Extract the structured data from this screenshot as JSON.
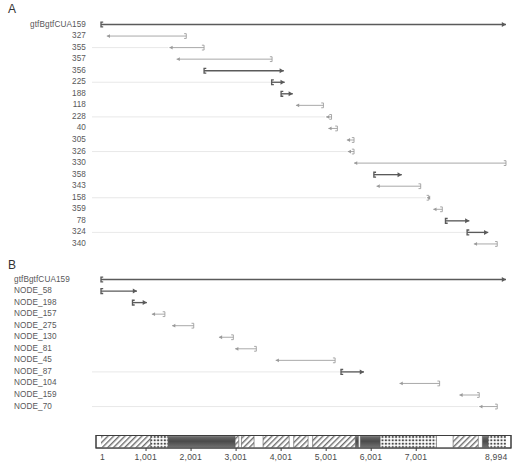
{
  "figure": {
    "type": "genomic-alignment-map",
    "width": 515,
    "height": 473,
    "accent": "#6b6b6b",
    "dark_bar": "#5a5a5a",
    "light_bar": "#9a9a9a",
    "guide_line": "#d8d8d8",
    "text_color": "#58585a"
  },
  "panels": [
    {
      "letter": "A",
      "rows": [
        {
          "label": "gtfBgtfCUA159",
          "start": 1,
          "end": 8994,
          "orientation": "right",
          "weight": "heavy",
          "guide": false
        },
        {
          "label": "327",
          "start": 130,
          "end": 1895,
          "orientation": "left",
          "weight": "light",
          "guide": false
        },
        {
          "label": "355",
          "start": 1520,
          "end": 2290,
          "orientation": "left",
          "weight": "light",
          "guide": true
        },
        {
          "label": "357",
          "start": 1680,
          "end": 3800,
          "orientation": "left",
          "weight": "light",
          "guide": false
        },
        {
          "label": "356",
          "start": 2290,
          "end": 4060,
          "orientation": "right",
          "weight": "heavy",
          "guide": false
        },
        {
          "label": "225",
          "start": 3790,
          "end": 4080,
          "orientation": "right",
          "weight": "heavy",
          "guide": true
        },
        {
          "label": "188",
          "start": 4000,
          "end": 4260,
          "orientation": "right",
          "weight": "heavy",
          "guide": false
        },
        {
          "label": "118",
          "start": 4330,
          "end": 4940,
          "orientation": "left",
          "weight": "light",
          "guide": false
        },
        {
          "label": "228",
          "start": 5000,
          "end": 5120,
          "orientation": "left",
          "weight": "light",
          "guide": true
        },
        {
          "label": "40",
          "start": 5050,
          "end": 5250,
          "orientation": "left",
          "weight": "light",
          "guide": false
        },
        {
          "label": "305",
          "start": 5460,
          "end": 5620,
          "orientation": "left",
          "weight": "light",
          "guide": false
        },
        {
          "label": "326",
          "start": 5480,
          "end": 5620,
          "orientation": "left",
          "weight": "light",
          "guide": true
        },
        {
          "label": "330",
          "start": 5620,
          "end": 9000,
          "orientation": "left",
          "weight": "light",
          "guide": false
        },
        {
          "label": "358",
          "start": 6060,
          "end": 6680,
          "orientation": "right",
          "weight": "heavy",
          "guide": false
        },
        {
          "label": "343",
          "start": 6120,
          "end": 7100,
          "orientation": "left",
          "weight": "light",
          "guide": false
        },
        {
          "label": "158",
          "start": 7240,
          "end": 7280,
          "orientation": "left",
          "weight": "light",
          "guide": true
        },
        {
          "label": "359",
          "start": 7380,
          "end": 7580,
          "orientation": "left",
          "weight": "light",
          "guide": false
        },
        {
          "label": "78",
          "start": 7650,
          "end": 8180,
          "orientation": "right",
          "weight": "heavy",
          "guide": false
        },
        {
          "label": "324",
          "start": 8130,
          "end": 8600,
          "orientation": "right",
          "weight": "heavy",
          "guide": true
        },
        {
          "label": "340",
          "start": 8280,
          "end": 8800,
          "orientation": "left",
          "weight": "light",
          "guide": false
        }
      ]
    },
    {
      "letter": "B",
      "rows": [
        {
          "label": "gtfBgtfCUA159",
          "start": 1,
          "end": 8994,
          "orientation": "right",
          "weight": "heavy",
          "guide": false
        },
        {
          "label": "NODE_58",
          "start": 1,
          "end": 800,
          "orientation": "right",
          "weight": "heavy",
          "guide": false
        },
        {
          "label": "NODE_198",
          "start": 700,
          "end": 1020,
          "orientation": "right",
          "weight": "heavy",
          "guide": false
        },
        {
          "label": "NODE_157",
          "start": 1130,
          "end": 1420,
          "orientation": "left",
          "weight": "light",
          "guide": false
        },
        {
          "label": "NODE_275",
          "start": 1580,
          "end": 2060,
          "orientation": "left",
          "weight": "light",
          "guide": false
        },
        {
          "label": "NODE_130",
          "start": 2620,
          "end": 2940,
          "orientation": "left",
          "weight": "light",
          "guide": false
        },
        {
          "label": "NODE_81",
          "start": 2980,
          "end": 3450,
          "orientation": "left",
          "weight": "light",
          "guide": false
        },
        {
          "label": "NODE_45",
          "start": 3880,
          "end": 5200,
          "orientation": "left",
          "weight": "light",
          "guide": false
        },
        {
          "label": "NODE_87",
          "start": 5330,
          "end": 5840,
          "orientation": "right",
          "weight": "heavy",
          "guide": true
        },
        {
          "label": "NODE_104",
          "start": 6630,
          "end": 7520,
          "orientation": "left",
          "weight": "light",
          "guide": false
        },
        {
          "label": "NODE_159",
          "start": 7960,
          "end": 8400,
          "orientation": "left",
          "weight": "light",
          "guide": false
        },
        {
          "label": "NODE_70",
          "start": 8400,
          "end": 8800,
          "orientation": "left",
          "weight": "light",
          "guide": true
        }
      ]
    }
  ],
  "axis": {
    "label_name": "coordinate-axis",
    "min": 1,
    "max": 8994,
    "ticks": [
      {
        "value": 1,
        "label": "1"
      },
      {
        "value": 1001,
        "label": "1,001"
      },
      {
        "value": 2001,
        "label": "2,001"
      },
      {
        "value": 3001,
        "label": "3,001"
      },
      {
        "value": 4001,
        "label": "4,001"
      },
      {
        "value": 5001,
        "label": "5,001"
      },
      {
        "value": 6001,
        "label": "6,001"
      },
      {
        "value": 7001,
        "label": "7,001"
      },
      {
        "value": 8994,
        "label": "8,994"
      }
    ],
    "segments": [
      {
        "start": 1,
        "end": 1100,
        "fill": "hatch"
      },
      {
        "start": 1100,
        "end": 1490,
        "fill": "dots"
      },
      {
        "start": 1490,
        "end": 2980,
        "fill": "solid-dark"
      },
      {
        "start": 2980,
        "end": 3060,
        "fill": "hatch"
      },
      {
        "start": 3060,
        "end": 3120,
        "fill": "white"
      },
      {
        "start": 3120,
        "end": 3400,
        "fill": "hatch"
      },
      {
        "start": 3400,
        "end": 3600,
        "fill": "white"
      },
      {
        "start": 3600,
        "end": 4180,
        "fill": "hatch"
      },
      {
        "start": 4180,
        "end": 4280,
        "fill": "white"
      },
      {
        "start": 4280,
        "end": 4600,
        "fill": "hatch"
      },
      {
        "start": 4600,
        "end": 4700,
        "fill": "white"
      },
      {
        "start": 4700,
        "end": 5650,
        "fill": "hatch"
      },
      {
        "start": 5650,
        "end": 5720,
        "fill": "solid-dark"
      },
      {
        "start": 5720,
        "end": 5760,
        "fill": "white"
      },
      {
        "start": 5760,
        "end": 6200,
        "fill": "solid-dark"
      },
      {
        "start": 6200,
        "end": 7450,
        "fill": "dots"
      },
      {
        "start": 7450,
        "end": 7820,
        "fill": "white"
      },
      {
        "start": 7820,
        "end": 8380,
        "fill": "hatch"
      },
      {
        "start": 8380,
        "end": 8470,
        "fill": "white"
      },
      {
        "start": 8470,
        "end": 8600,
        "fill": "solid-dark"
      },
      {
        "start": 8600,
        "end": 8994,
        "fill": "dots"
      }
    ]
  }
}
